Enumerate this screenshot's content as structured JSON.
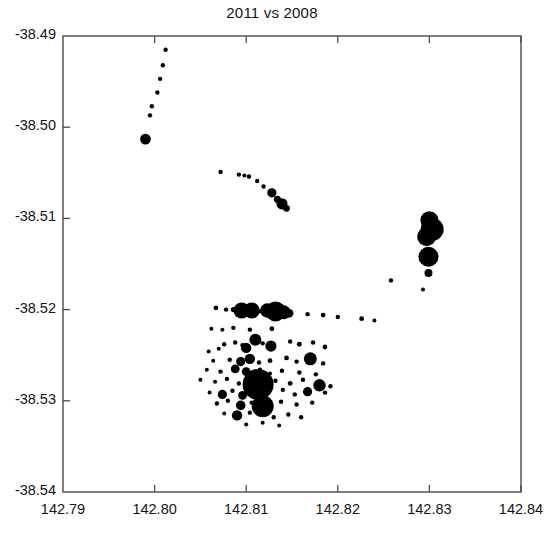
{
  "chart_data": {
    "type": "scatter",
    "title": "2011 vs 2008",
    "xlabel": "",
    "ylabel": "",
    "xlim": [
      142.79,
      142.84
    ],
    "ylim": [
      -38.54,
      -38.49
    ],
    "xticks": [
      "142.79",
      "142.80",
      "142.81",
      "142.82",
      "142.83",
      "142.84"
    ],
    "xtick_values": [
      142.79,
      142.8,
      142.81,
      142.82,
      142.83,
      142.84
    ],
    "yticks": [
      "-38.49",
      "-38.50",
      "-38.51",
      "-38.52",
      "-38.53",
      "-38.54"
    ],
    "ytick_values": [
      -38.49,
      -38.5,
      -38.51,
      -38.52,
      -38.53,
      -38.54
    ],
    "grid": false,
    "legend": null,
    "marker_color": "#000000",
    "frame_color": "#4a4a4a",
    "size_encoding": "marker area proportional to magnitude",
    "points": [
      {
        "x": 142.8012,
        "y": -38.4915,
        "s": 2.2
      },
      {
        "x": 142.8009,
        "y": -38.4932,
        "s": 2.2
      },
      {
        "x": 142.8006,
        "y": -38.4947,
        "s": 2.2
      },
      {
        "x": 142.8003,
        "y": -38.4962,
        "s": 2.2
      },
      {
        "x": 142.7997,
        "y": -38.4977,
        "s": 2.2
      },
      {
        "x": 142.7995,
        "y": -38.4987,
        "s": 2.2
      },
      {
        "x": 142.799,
        "y": -38.5013,
        "s": 5.4
      },
      {
        "x": 142.8072,
        "y": -38.5049,
        "s": 2.2
      },
      {
        "x": 142.8092,
        "y": -38.5052,
        "s": 2.2
      },
      {
        "x": 142.8098,
        "y": -38.5053,
        "s": 2.0
      },
      {
        "x": 142.8103,
        "y": -38.5054,
        "s": 2.2
      },
      {
        "x": 142.8112,
        "y": -38.5059,
        "s": 2.2
      },
      {
        "x": 142.8119,
        "y": -38.5065,
        "s": 2.2
      },
      {
        "x": 142.8128,
        "y": -38.5072,
        "s": 4.6
      },
      {
        "x": 142.8134,
        "y": -38.5079,
        "s": 3.6
      },
      {
        "x": 142.8139,
        "y": -38.5084,
        "s": 5.6
      },
      {
        "x": 142.8144,
        "y": -38.5089,
        "s": 3.4
      },
      {
        "x": 142.83,
        "y": -38.5102,
        "s": 9.0
      },
      {
        "x": 142.8303,
        "y": -38.5112,
        "s": 11.5
      },
      {
        "x": 142.8297,
        "y": -38.512,
        "s": 9.5
      },
      {
        "x": 142.8299,
        "y": -38.5142,
        "s": 10.0
      },
      {
        "x": 142.8299,
        "y": -38.516,
        "s": 4.0
      },
      {
        "x": 142.8258,
        "y": -38.5168,
        "s": 2.2
      },
      {
        "x": 142.8293,
        "y": -38.5178,
        "s": 2.0
      },
      {
        "x": 142.8067,
        "y": -38.5198,
        "s": 2.4
      },
      {
        "x": 142.8078,
        "y": -38.52,
        "s": 2.2
      },
      {
        "x": 142.8086,
        "y": -38.52,
        "s": 2.6
      },
      {
        "x": 142.8095,
        "y": -38.5201,
        "s": 8.0
      },
      {
        "x": 142.8106,
        "y": -38.5201,
        "s": 8.0
      },
      {
        "x": 142.8114,
        "y": -38.5202,
        "s": 2.2
      },
      {
        "x": 142.8123,
        "y": -38.5201,
        "s": 7.2
      },
      {
        "x": 142.8132,
        "y": -38.5202,
        "s": 10.0
      },
      {
        "x": 142.8141,
        "y": -38.5203,
        "s": 7.0
      },
      {
        "x": 142.8147,
        "y": -38.5204,
        "s": 4.2
      },
      {
        "x": 142.8167,
        "y": -38.5205,
        "s": 2.2
      },
      {
        "x": 142.8184,
        "y": -38.5206,
        "s": 2.4
      },
      {
        "x": 142.82,
        "y": -38.5208,
        "s": 2.2
      },
      {
        "x": 142.8226,
        "y": -38.521,
        "s": 2.4
      },
      {
        "x": 142.824,
        "y": -38.5212,
        "s": 2.0
      },
      {
        "x": 142.8062,
        "y": -38.5221,
        "s": 2.0
      },
      {
        "x": 142.8074,
        "y": -38.5222,
        "s": 2.0
      },
      {
        "x": 142.8086,
        "y": -38.522,
        "s": 2.2
      },
      {
        "x": 142.8104,
        "y": -38.5222,
        "s": 2.2
      },
      {
        "x": 142.8128,
        "y": -38.5221,
        "s": 2.4
      },
      {
        "x": 142.8076,
        "y": -38.5238,
        "s": 2.2
      },
      {
        "x": 142.8088,
        "y": -38.5236,
        "s": 2.2
      },
      {
        "x": 142.8096,
        "y": -38.5239,
        "s": 2.2
      },
      {
        "x": 142.811,
        "y": -38.5233,
        "s": 6.0
      },
      {
        "x": 142.8118,
        "y": -38.5237,
        "s": 2.2
      },
      {
        "x": 142.8127,
        "y": -38.524,
        "s": 5.6
      },
      {
        "x": 142.81,
        "y": -38.5242,
        "s": 5.2
      },
      {
        "x": 142.8148,
        "y": -38.5235,
        "s": 2.2
      },
      {
        "x": 142.8158,
        "y": -38.5238,
        "s": 2.4
      },
      {
        "x": 142.8173,
        "y": -38.5236,
        "s": 2.2
      },
      {
        "x": 142.8186,
        "y": -38.5241,
        "s": 2.4
      },
      {
        "x": 142.807,
        "y": -38.5243,
        "s": 2.0
      },
      {
        "x": 142.8059,
        "y": -38.5246,
        "s": 2.0
      },
      {
        "x": 142.8064,
        "y": -38.5256,
        "s": 2.0
      },
      {
        "x": 142.8082,
        "y": -38.5255,
        "s": 2.2
      },
      {
        "x": 142.8094,
        "y": -38.5257,
        "s": 4.6
      },
      {
        "x": 142.8104,
        "y": -38.5254,
        "s": 5.2
      },
      {
        "x": 142.8114,
        "y": -38.5258,
        "s": 2.2
      },
      {
        "x": 142.8126,
        "y": -38.5256,
        "s": 2.4
      },
      {
        "x": 142.8144,
        "y": -38.5253,
        "s": 2.4
      },
      {
        "x": 142.8155,
        "y": -38.5257,
        "s": 2.2
      },
      {
        "x": 142.817,
        "y": -38.5254,
        "s": 6.5
      },
      {
        "x": 142.8184,
        "y": -38.5259,
        "s": 2.2
      },
      {
        "x": 142.8057,
        "y": -38.5266,
        "s": 2.0
      },
      {
        "x": 142.8072,
        "y": -38.5268,
        "s": 2.2
      },
      {
        "x": 142.8088,
        "y": -38.5265,
        "s": 4.4
      },
      {
        "x": 142.81,
        "y": -38.5268,
        "s": 4.4
      },
      {
        "x": 142.8115,
        "y": -38.5266,
        "s": 2.2
      },
      {
        "x": 142.8126,
        "y": -38.527,
        "s": 2.0
      },
      {
        "x": 142.8139,
        "y": -38.5267,
        "s": 2.2
      },
      {
        "x": 142.8158,
        "y": -38.5269,
        "s": 2.2
      },
      {
        "x": 142.8176,
        "y": -38.5271,
        "s": 2.2
      },
      {
        "x": 142.805,
        "y": -38.5277,
        "s": 2.0
      },
      {
        "x": 142.8066,
        "y": -38.5279,
        "s": 2.0
      },
      {
        "x": 142.8079,
        "y": -38.5276,
        "s": 2.2
      },
      {
        "x": 142.8092,
        "y": -38.5281,
        "s": 2.2
      },
      {
        "x": 142.8113,
        "y": -38.5282,
        "s": 15.5
      },
      {
        "x": 142.8132,
        "y": -38.5278,
        "s": 2.2
      },
      {
        "x": 142.8148,
        "y": -38.5281,
        "s": 2.4
      },
      {
        "x": 142.8162,
        "y": -38.5277,
        "s": 2.2
      },
      {
        "x": 142.818,
        "y": -38.528,
        "s": 2.4
      },
      {
        "x": 142.8192,
        "y": -38.5284,
        "s": 2.2
      },
      {
        "x": 142.806,
        "y": -38.5291,
        "s": 2.0
      },
      {
        "x": 142.8074,
        "y": -38.5293,
        "s": 4.6
      },
      {
        "x": 142.8085,
        "y": -38.5289,
        "s": 2.2
      },
      {
        "x": 142.8096,
        "y": -38.5294,
        "s": 4.4
      },
      {
        "x": 142.814,
        "y": -38.5288,
        "s": 2.2
      },
      {
        "x": 142.8153,
        "y": -38.5293,
        "s": 2.2
      },
      {
        "x": 142.8167,
        "y": -38.529,
        "s": 4.6
      },
      {
        "x": 142.8186,
        "y": -38.5291,
        "s": 2.2
      },
      {
        "x": 142.8068,
        "y": -38.5303,
        "s": 2.2
      },
      {
        "x": 142.808,
        "y": -38.53,
        "s": 2.2
      },
      {
        "x": 142.8094,
        "y": -38.5305,
        "s": 4.8
      },
      {
        "x": 142.8106,
        "y": -38.5302,
        "s": 2.2
      },
      {
        "x": 142.8118,
        "y": -38.5306,
        "s": 11.0
      },
      {
        "x": 142.8138,
        "y": -38.5301,
        "s": 2.2
      },
      {
        "x": 142.8155,
        "y": -38.5304,
        "s": 2.2
      },
      {
        "x": 142.8172,
        "y": -38.5302,
        "s": 2.2
      },
      {
        "x": 142.8076,
        "y": -38.5314,
        "s": 2.0
      },
      {
        "x": 142.809,
        "y": -38.5316,
        "s": 5.2
      },
      {
        "x": 142.8104,
        "y": -38.5313,
        "s": 2.2
      },
      {
        "x": 142.813,
        "y": -38.5318,
        "s": 2.2
      },
      {
        "x": 142.8146,
        "y": -38.5315,
        "s": 2.2
      },
      {
        "x": 142.816,
        "y": -38.5318,
        "s": 2.2
      },
      {
        "x": 142.81,
        "y": -38.5326,
        "s": 2.0
      },
      {
        "x": 142.8118,
        "y": -38.5324,
        "s": 2.0
      },
      {
        "x": 142.8136,
        "y": -38.5327,
        "s": 2.0
      },
      {
        "x": 142.818,
        "y": -38.5283,
        "s": 6.2
      }
    ]
  }
}
